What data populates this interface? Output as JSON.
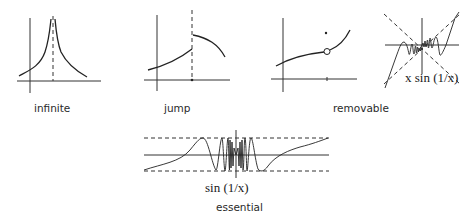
{
  "figure": {
    "panels": [
      {
        "id": "infinite",
        "label": "infinite"
      },
      {
        "id": "jump",
        "label": "jump"
      },
      {
        "id": "removable",
        "label": "removable"
      },
      {
        "id": "xsin",
        "label": "",
        "formula_label": "x sin (1/x)"
      },
      {
        "id": "essential",
        "label": "essential",
        "formula_label": "sin (1/x)"
      }
    ]
  },
  "colors": {
    "background": "#ffffff",
    "ink": "#222222"
  }
}
